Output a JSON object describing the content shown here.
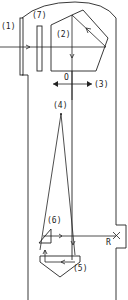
{
  "diagram": {
    "type": "optical-schematic",
    "labels": {
      "l1": "(1)",
      "l2": "(2)",
      "l3": "(3)",
      "l4": "(4)",
      "l5": "(5)",
      "l6": "(6)",
      "l7": "(7)",
      "o": "O",
      "r": "R"
    },
    "components": [
      {
        "id": "1",
        "label": "(1)",
        "shape": "vertical plate (entrance window)"
      },
      {
        "id": "7",
        "label": "(7)",
        "shape": "vertical rectangle (filter)"
      },
      {
        "id": "2",
        "label": "(2)",
        "shape": "pentaprism"
      },
      {
        "id": "3",
        "label": "(3)",
        "shape": "double-headed horizontal arrow (movement)"
      },
      {
        "id": "4",
        "label": "(4)",
        "shape": "focal point / apex of converging rays"
      },
      {
        "id": "5",
        "label": "(5)",
        "shape": "roof prism (lower)"
      },
      {
        "id": "6",
        "label": "(6)",
        "shape": "small right-angle prism"
      },
      {
        "id": "O",
        "label": "O",
        "shape": "optical axis marker"
      },
      {
        "id": "R",
        "label": "R",
        "shape": "cross marker (receiver)"
      }
    ],
    "stroke_color": "#222222",
    "background": "#ffffff"
  }
}
